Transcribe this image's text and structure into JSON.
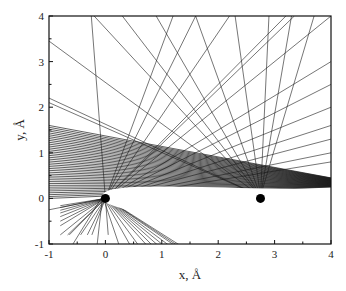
{
  "chart_data": {
    "type": "line",
    "title": "",
    "xlabel": "x, Å",
    "ylabel": "y, Å",
    "xlim": [
      -1,
      4
    ],
    "ylim": [
      -1,
      4
    ],
    "xticks": [
      -1,
      0,
      1,
      2,
      3,
      4
    ],
    "yticks": [
      -1,
      0,
      1,
      2,
      3,
      4
    ],
    "grid": false,
    "legend": null,
    "atoms": [
      {
        "x": 0.0,
        "y": 0.0,
        "label": "atom-1"
      },
      {
        "x": 2.75,
        "y": 0.0,
        "label": "atom-2"
      }
    ],
    "series_description": "Family of straight trajectory lines: a dense band entering from the left (y≈0.0–1.6 at x=-1) converging over the atoms toward y≈0.3 at x=4, fans of lines radiating from near each atom toward the top edge, and a fan of lines from atom-1 down to the bottom-left region.",
    "line_families": {
      "dense_band": {
        "x0": -1,
        "y0_range": [
          0.0,
          1.6
        ],
        "x1": 4,
        "y1_range": [
          0.25,
          0.45
        ],
        "count": 40
      },
      "upper_fan_atom2": {
        "origin": [
          2.75,
          0.05
        ],
        "targets_top_x": [
          -0.2,
          0.3,
          0.9,
          1.6,
          2.3,
          2.9,
          3.3,
          3.7
        ],
        "targets_left_y": [
          3.45,
          2.2,
          2.1
        ],
        "count": 11
      },
      "upper_fan_atom1": {
        "origin": [
          0.0,
          0.0
        ],
        "targets_top_x": [
          -0.25,
          1.2,
          1.6,
          2.2,
          3.2,
          3.35,
          4.0
        ],
        "targets_right_y": [
          3.0,
          2.5,
          2.0,
          1.6,
          1.3,
          1.0,
          0.8
        ],
        "count": 14
      },
      "lower_fan_atom1": {
        "origin": [
          0.0,
          0.0
        ],
        "targets_bottom_x": [
          -0.6,
          -0.15,
          0.25,
          0.45,
          0.6,
          0.75,
          0.85,
          0.95,
          1.05,
          1.15,
          1.25,
          1.3,
          1.35
        ],
        "targets_left_y": [
          -0.25
        ],
        "count": 14
      }
    },
    "shadow_region": {
      "description": "White teardrop-shaped region behind atom-1 extending to x=4 between y≈-0.9 and y≈0.1"
    }
  },
  "axes": {
    "x_title": "x, Å",
    "y_title": "y, Å",
    "x_tick_labels": [
      "-1",
      "0",
      "1",
      "2",
      "3",
      "4"
    ],
    "y_tick_labels": [
      "-1",
      "0",
      "1",
      "2",
      "3",
      "4"
    ]
  },
  "colors": {
    "line": "#1a1a1a",
    "axis": "#111111",
    "atom": "#000000",
    "background": "#ffffff"
  }
}
